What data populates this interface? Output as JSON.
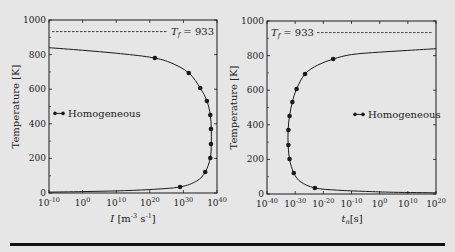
{
  "figure": {
    "background": "#e6e6e6",
    "line_color": "#1a1a1a"
  },
  "chart_data": [
    {
      "type": "line",
      "title": "",
      "xlabel": "I [m^-3 s^-1]",
      "xlabel_main": "I",
      "xlabel_unit": "[m",
      "xlabel_unit_exp1": "-3",
      "xlabel_unit_mid": " s",
      "xlabel_unit_exp2": "-1",
      "xlabel_unit_end": "]",
      "ylabel": "Temperature [K]",
      "xscale": "log",
      "xlim_exp": [
        -10,
        40
      ],
      "ylim": [
        0,
        1000
      ],
      "x_ticks": [
        "10^-10",
        "10^0",
        "10^10",
        "10^20",
        "10^30",
        "10^40"
      ],
      "x_tick_base": "10",
      "x_tick_exps": [
        "-10",
        "0",
        "10",
        "20",
        "30",
        "40"
      ],
      "y_ticks": [
        "0",
        "200",
        "400",
        "600",
        "800",
        "1000"
      ],
      "reference_line": {
        "label": "T_f = 933",
        "label_main": "T",
        "label_sub": "f",
        "label_value": "= 933",
        "value": 933,
        "style": "dashed"
      },
      "legend": {
        "entries": [
          "Homogeneous"
        ],
        "position": "left-middle"
      },
      "series": [
        {
          "name": "Homogeneous",
          "marker": "circle",
          "points_log10x_T": [
            [
              21.5,
              780
            ],
            [
              31.6,
              694
            ],
            [
              35.0,
              607
            ],
            [
              37.0,
              532
            ],
            [
              38.0,
              451
            ],
            [
              38.2,
              370
            ],
            [
              38.2,
              283
            ],
            [
              38.0,
              202
            ],
            [
              36.5,
              121
            ],
            [
              29.0,
              35
            ]
          ]
        }
      ],
      "curve_log10x_T": [
        [
          -10,
          840
        ],
        [
          0,
          825
        ],
        [
          10,
          808
        ],
        [
          20,
          785
        ],
        [
          26,
          755
        ],
        [
          31.6,
          694
        ],
        [
          35,
          607
        ],
        [
          37,
          532
        ],
        [
          38,
          451
        ],
        [
          38.3,
          370
        ],
        [
          38.3,
          283
        ],
        [
          38,
          202
        ],
        [
          36.5,
          121
        ],
        [
          34,
          70
        ],
        [
          29,
          35
        ],
        [
          20,
          20
        ],
        [
          10,
          12
        ],
        [
          0,
          8
        ],
        [
          -10,
          5
        ]
      ]
    },
    {
      "type": "line",
      "title": "",
      "xlabel": "t_n [s]",
      "xlabel_main": "t",
      "xlabel_sub": "n",
      "xlabel_unit": "[s]",
      "ylabel": "Temperature [K]",
      "xscale": "log",
      "xlim_exp": [
        -40,
        20
      ],
      "ylim": [
        0,
        1000
      ],
      "x_ticks": [
        "10^-40",
        "10^-30",
        "10^-20",
        "10^-10",
        "10^0",
        "10^10",
        "10^20"
      ],
      "x_tick_base": "10",
      "x_tick_exps": [
        "-40",
        "-30",
        "-20",
        "-10",
        "0",
        "10",
        "20"
      ],
      "y_ticks": [
        "0",
        "200",
        "400",
        "600",
        "800",
        "1000"
      ],
      "reference_line": {
        "label": "T_f = 933",
        "label_main": "T",
        "label_sub": "f",
        "label_value": "= 933",
        "value": 933,
        "style": "dashed"
      },
      "legend": {
        "entries": [
          "Homogeneous"
        ],
        "position": "right-middle"
      },
      "series": [
        {
          "name": "Homogeneous",
          "marker": "circle",
          "points_log10x_T": [
            [
              -16.5,
              780
            ],
            [
              -26.5,
              694
            ],
            [
              -29.5,
              607
            ],
            [
              -31.0,
              532
            ],
            [
              -32.0,
              451
            ],
            [
              -32.4,
              370
            ],
            [
              -32.4,
              283
            ],
            [
              -32.0,
              202
            ],
            [
              -30.5,
              121
            ],
            [
              -23.0,
              35
            ]
          ]
        }
      ],
      "curve_log10x_T": [
        [
          20,
          840
        ],
        [
          10,
          830
        ],
        [
          0,
          820
        ],
        [
          -10,
          806
        ],
        [
          -16.5,
          780
        ],
        [
          -22,
          745
        ],
        [
          -26.5,
          694
        ],
        [
          -29.5,
          607
        ],
        [
          -31,
          532
        ],
        [
          -32,
          451
        ],
        [
          -32.5,
          370
        ],
        [
          -32.5,
          283
        ],
        [
          -32,
          202
        ],
        [
          -30.5,
          121
        ],
        [
          -28,
          70
        ],
        [
          -23,
          35
        ],
        [
          -15,
          22
        ],
        [
          -5,
          15
        ],
        [
          5,
          10
        ],
        [
          20,
          7
        ]
      ]
    }
  ]
}
